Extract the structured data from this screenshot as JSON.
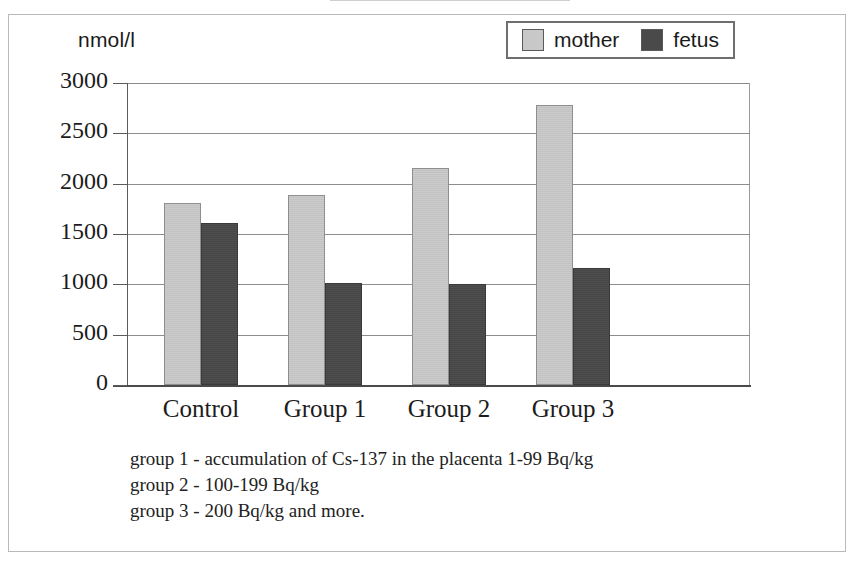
{
  "y_axis": {
    "unit_label": "nmol/l",
    "ticks": [
      "3000",
      "2500",
      "2000",
      "1500",
      "1000",
      "500",
      "0"
    ]
  },
  "legend": {
    "items": [
      {
        "label": "mother",
        "color": "#c8c8c8"
      },
      {
        "label": "fetus",
        "color": "#4a4a4a"
      }
    ]
  },
  "categories": {
    "c0": "Control",
    "c1": "Group 1",
    "c2": "Group 2",
    "c3": "Group 3"
  },
  "notes": {
    "line1": "group 1 - accumulation of Cs-137 in the placenta 1-99 Bq/kg",
    "line2": "group 2 - 100-199 Bq/kg",
    "line3": "group 3 - 200 Bq/kg and more."
  },
  "chart_data": {
    "type": "bar",
    "title": "",
    "xlabel": "",
    "ylabel": "nmol/l",
    "ylim": [
      0,
      3000
    ],
    "ytick_step": 500,
    "grid": true,
    "legend_position": "top-right",
    "categories": [
      "Control",
      "Group 1",
      "Group 2",
      "Group 3"
    ],
    "series": [
      {
        "name": "mother",
        "color": "#c8c8c8",
        "values": [
          1805,
          1885,
          2155,
          2785
        ]
      },
      {
        "name": "fetus",
        "color": "#4a4a4a",
        "values": [
          1605,
          1015,
          1000,
          1160
        ]
      }
    ],
    "annotations": [
      "group 1 - accumulation of Cs-137 in the placenta 1-99 Bq/kg",
      "group 2 - 100-199 Bq/kg",
      "group 3 - 200 Bq/kg and more."
    ]
  }
}
